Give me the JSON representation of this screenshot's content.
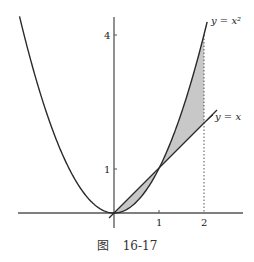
{
  "chart_data": {
    "type": "line",
    "title": "",
    "caption": "图 16-17",
    "xlabel": "",
    "ylabel": "",
    "xlim": [
      -2.1,
      2.8
    ],
    "ylim": [
      -0.3,
      4.4
    ],
    "grid": false,
    "x_ticks": [
      1,
      2
    ],
    "y_ticks": [
      1,
      4
    ],
    "series": [
      {
        "name": "y = x²",
        "function": "x^2",
        "x": [
          -2.1,
          -2,
          -1,
          0,
          1,
          2,
          2.07
        ],
        "values": [
          4.41,
          4,
          1,
          0,
          1,
          4,
          4.28
        ]
      },
      {
        "name": "y = x",
        "function": "x",
        "x": [
          -0.1,
          0,
          1,
          2,
          2.3
        ],
        "values": [
          -0.1,
          0,
          1,
          2,
          2.3
        ]
      }
    ],
    "shaded_regions": [
      {
        "between": [
          "y = x",
          "y = x²"
        ],
        "x_range": [
          0,
          1
        ],
        "color": "#c8c8c8"
      },
      {
        "between": [
          "y = x",
          "y = x²"
        ],
        "x_range": [
          1,
          2
        ],
        "color": "#c8c8c8"
      }
    ],
    "annotations": [
      {
        "text": "y = x²",
        "at": "upper end of parabola"
      },
      {
        "text": "y = x",
        "at": "upper end of line"
      },
      {
        "type": "dotted_vertical",
        "x": 2,
        "y_range": [
          0,
          4
        ]
      }
    ]
  },
  "labels": {
    "parabola": "y = x²",
    "line": "y = x",
    "tick_x1": "1",
    "tick_x2": "2",
    "tick_y1": "1",
    "tick_y4": "4"
  },
  "caption": {
    "figure_word": "图",
    "number": "16-17"
  },
  "colors": {
    "curve": "#2a2a2a",
    "fill": "#c8c8c8",
    "axis": "#555555"
  }
}
